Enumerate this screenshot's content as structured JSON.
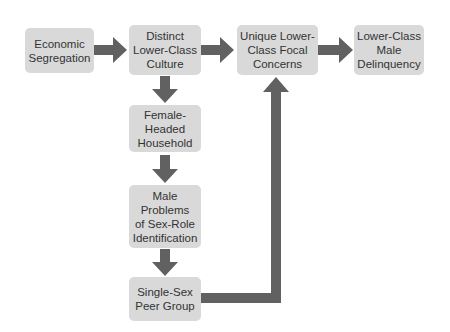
{
  "diagram": {
    "type": "flowchart",
    "colors": {
      "box_fill": "#d9d9d9",
      "arrow": "#616161",
      "text": "#333333",
      "background": "#ffffff"
    },
    "nodes": [
      {
        "id": "econ",
        "label": "Economic\nSegregation"
      },
      {
        "id": "culture",
        "label": "Distinct\nLower-Class\nCulture"
      },
      {
        "id": "focal",
        "label": "Unique Lower-\nClass Focal\nConcerns"
      },
      {
        "id": "delinq",
        "label": "Lower-Class\nMale\nDelinquency"
      },
      {
        "id": "female",
        "label": "Female-\nHeaded\nHousehold"
      },
      {
        "id": "male",
        "label": "Male\nProblems\nof Sex-Role\nIdentification"
      },
      {
        "id": "peer",
        "label": "Single-Sex\nPeer Group"
      }
    ],
    "edges": [
      {
        "from": "econ",
        "to": "culture"
      },
      {
        "from": "culture",
        "to": "focal"
      },
      {
        "from": "focal",
        "to": "delinq"
      },
      {
        "from": "culture",
        "to": "female"
      },
      {
        "from": "female",
        "to": "male"
      },
      {
        "from": "male",
        "to": "peer"
      },
      {
        "from": "peer",
        "to": "focal"
      }
    ]
  }
}
